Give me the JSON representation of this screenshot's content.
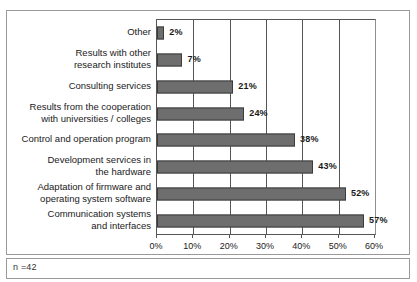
{
  "note": "n =42",
  "colors": {
    "bar_fill": "#6e6e6e",
    "bar_stroke": "#3c3c3c",
    "frame": "#9a9a9a",
    "axis": "#555555",
    "text": "#1a1a1a"
  },
  "chart_data": {
    "type": "bar",
    "orientation": "horizontal",
    "title": "",
    "xlabel": "",
    "ylabel": "",
    "xlim": [
      0,
      60
    ],
    "xticks": [
      0,
      10,
      20,
      30,
      40,
      50,
      60
    ],
    "xtick_labels": [
      "0%",
      "10%",
      "20%",
      "30%",
      "40%",
      "50%",
      "60%"
    ],
    "grid": "vertical",
    "legend": "none",
    "value_suffix": "%",
    "categories": [
      "Other",
      "Results with other\nresearch institutes",
      "Consulting services",
      "Results from the cooperation\nwith  universities / colleges",
      "Control and operation program",
      "Development  services  in\nthe hardware",
      "Adaptation of firmware and\noperating system software",
      "Communication systems\nand interfaces"
    ],
    "values": [
      2,
      7,
      21,
      24,
      38,
      43,
      52,
      57
    ],
    "value_labels": [
      "2%",
      "7%",
      "21%",
      "24%",
      "38%",
      "43%",
      "52%",
      "57%"
    ]
  }
}
